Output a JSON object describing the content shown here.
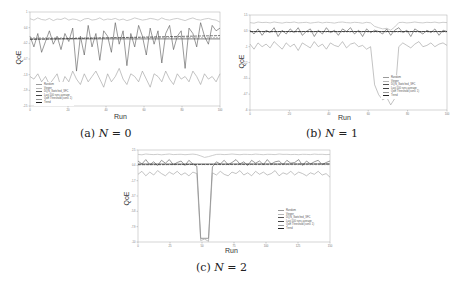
{
  "figure": {
    "captions": {
      "a": {
        "prefix": "(a) ",
        "var": "N",
        "eq": " = 0"
      },
      "b": {
        "prefix": "(b) ",
        "var": "N",
        "eq": " = 1"
      },
      "c": {
        "prefix": "(c) ",
        "var": "N",
        "eq": " = 2"
      }
    },
    "xlabel": "Run",
    "ylabel": "QoE",
    "legend": [
      "Random",
      "Viewer",
      "DQN_Switched_SFC",
      "Last 100 runs average",
      "QoE Threshold (conv. 1)",
      "Trend"
    ]
  },
  "chart_data": [
    {
      "type": "line",
      "title": "(a) N = 0",
      "xlabel": "Run",
      "ylabel": "QoE",
      "xticks": [
        0,
        20,
        40,
        60,
        80,
        100
      ],
      "xlim": [
        0,
        100
      ],
      "ylim": [
        -2.5,
        1.0
      ],
      "legend_position": "lower left",
      "grid": false,
      "series": [
        {
          "name": "Viewer",
          "values": [
            0.75,
            0.7,
            0.78,
            0.72,
            0.7,
            0.76,
            0.68,
            0.74,
            0.72,
            0.78,
            0.7,
            0.74,
            0.72,
            0.66,
            0.74,
            0.76,
            0.7,
            0.72,
            0.78,
            0.7,
            0.74,
            0.72,
            0.76,
            0.7,
            0.74,
            0.68,
            0.72,
            0.78,
            0.74,
            0.7,
            0.72,
            0.76,
            0.74,
            0.7,
            0.78,
            0.72,
            0.7,
            0.74,
            0.76,
            0.72,
            0.68,
            0.74,
            0.78,
            0.72,
            0.7,
            0.74,
            0.76,
            0.72,
            0.7,
            0.62
          ]
        },
        {
          "name": "DQN_Switched_SFC",
          "values": [
            0.1,
            -0.3,
            0.2,
            -0.5,
            -0.1,
            0.3,
            -0.2,
            0.1,
            -0.4,
            0.2,
            -0.1,
            0.4,
            -1.2,
            0.1,
            -0.6,
            0.5,
            -0.3,
            0.2,
            -0.8,
            0.3,
            0.1,
            -0.5,
            0.6,
            -0.2,
            0.3,
            -1.0,
            0.2,
            -0.3,
            0.5,
            0.1,
            -0.6,
            0.4,
            -0.2,
            0.3,
            -0.9,
            0.2,
            0.5,
            -0.4,
            0.1,
            0.3,
            -1.1,
            0.4,
            0.2,
            -0.3,
            0.6,
            0.1,
            -0.2,
            0.5,
            0.3,
            0.4
          ]
        },
        {
          "name": "Random",
          "values": [
            -1.4,
            -1.5,
            -1.3,
            -1.6,
            -1.4,
            -1.7,
            -1.5,
            -1.3,
            -1.8,
            -1.4,
            -1.6,
            -1.2,
            -1.5,
            -1.7,
            -1.3,
            -1.6,
            -1.4,
            -1.2,
            -1.5,
            -1.8,
            -1.3,
            -1.6,
            -1.4,
            -1.1,
            -1.5,
            -1.7,
            -1.3,
            -1.4,
            -1.6,
            -1.2,
            -1.5,
            -1.8,
            -1.3,
            -1.4,
            -1.6,
            -1.2,
            -1.5,
            -1.7,
            -1.3,
            -1.5,
            -1.4,
            -1.6,
            -1.2,
            -1.4,
            -1.7,
            -1.3,
            -1.5,
            -1.4,
            -1.6,
            -1.3
          ]
        },
        {
          "name": "Last 100 runs average",
          "values": [
            0.0,
            0.0,
            0.0,
            0.0,
            0.0,
            0.0,
            0.0,
            0.0,
            0.0,
            0.0,
            0.0,
            0.0,
            0.0,
            0.0,
            0.0,
            0.0,
            0.0,
            0.0,
            0.0,
            0.0,
            0.0,
            0.0,
            0.0,
            0.0,
            0.0,
            0.0,
            0.0,
            0.0,
            0.0,
            0.0,
            0.0,
            0.0,
            0.0,
            0.0,
            0.0,
            0.0,
            0.0,
            0.0,
            0.0,
            0.0,
            0.0,
            0.0,
            0.0,
            0.0,
            0.0,
            0.0,
            0.0,
            0.0,
            0.0,
            0.0
          ]
        },
        {
          "name": "QoE Threshold (conv. 1)",
          "values": [
            0.05
          ]
        },
        {
          "name": "Trend",
          "values": [
            -0.02,
            0.12
          ]
        }
      ]
    },
    {
      "type": "line",
      "title": "(b) N = 1",
      "xlabel": "Run",
      "ylabel": "QoE",
      "xticks": [
        0,
        20,
        40,
        60,
        80,
        100
      ],
      "xlim": [
        0,
        100
      ],
      "ylim": [
        -6,
        1.5
      ],
      "legend_position": "lower right",
      "grid": false,
      "series": [
        {
          "name": "Viewer",
          "values": [
            0.9,
            0.85,
            0.95,
            0.9,
            0.92,
            0.88,
            0.95,
            0.9,
            0.86,
            0.92,
            0.9,
            0.95,
            0.88,
            0.9,
            0.92,
            0.86,
            0.9,
            0.94,
            0.88,
            0.92,
            0.9,
            0.86,
            0.92,
            0.95,
            0.9,
            0.88,
            0.92,
            0.9,
            0.85,
            0.92,
            0.88,
            0.6,
            0.5,
            0.4,
            0.45,
            0.3,
            0.55,
            0.9,
            0.92,
            0.88,
            0.9,
            0.95,
            0.9,
            0.88,
            0.92,
            0.9,
            0.94,
            0.88,
            0.92,
            0.9
          ]
        },
        {
          "name": "DQN_Switched_SFC",
          "values": [
            0.3,
            0.0,
            0.4,
            -0.1,
            0.3,
            0.1,
            0.5,
            -0.2,
            0.3,
            0.0,
            0.4,
            0.1,
            0.5,
            -0.1,
            0.2,
            0.4,
            -0.2,
            0.3,
            0.0,
            0.5,
            0.1,
            0.3,
            -0.1,
            0.4,
            0.2,
            0.5,
            0.0,
            0.3,
            -0.2,
            0.4,
            0.1,
            0.3,
            0.2,
            0.0,
            0.4,
            -0.1,
            0.3,
            0.5,
            0.1,
            0.3,
            -0.2,
            0.4,
            0.2,
            0.0,
            0.3,
            0.1,
            0.4,
            -0.1,
            0.3,
            0.2
          ]
        },
        {
          "name": "Random",
          "values": [
            -0.8,
            -1.2,
            -0.7,
            -1.0,
            -0.8,
            -1.1,
            -0.6,
            -0.9,
            -1.2,
            -0.7,
            -1.0,
            -0.8,
            -1.3,
            -0.7,
            -0.9,
            -1.1,
            -0.6,
            -1.0,
            -0.8,
            -1.2,
            -0.7,
            -0.9,
            -1.0,
            -0.6,
            -1.1,
            -0.8,
            -0.7,
            -1.0,
            -0.9,
            -1.2,
            -1.0,
            -4.0,
            -4.8,
            -5.2,
            -5.0,
            -5.6,
            -5.1,
            -1.0,
            -0.7,
            -0.9,
            -1.1,
            -0.8,
            -0.6,
            -1.0,
            -0.9,
            -0.7,
            -1.0,
            -0.8,
            -0.7,
            -0.9
          ]
        },
        {
          "name": "Last 100 runs average",
          "values": [
            0.2
          ]
        },
        {
          "name": "QoE Threshold (conv. 1)",
          "values": [
            0.15
          ]
        },
        {
          "name": "Trend",
          "values": [
            0.2,
            0.2
          ]
        }
      ]
    },
    {
      "type": "line",
      "title": "(c) N = 2",
      "xlabel": "Run",
      "ylabel": "QoE",
      "xticks": [
        0,
        25,
        50,
        75,
        100,
        125,
        150
      ],
      "xlim": [
        0,
        150
      ],
      "ylim": [
        -10,
        2.5
      ],
      "legend_position": "lower right",
      "grid": false,
      "series": [
        {
          "name": "Viewer",
          "values": [
            1.9,
            1.85,
            1.95,
            1.9,
            1.88,
            1.92,
            1.85,
            1.9,
            1.95,
            1.88,
            1.9,
            1.92,
            1.86,
            1.9,
            1.94,
            1.88,
            1.7,
            1.5,
            1.6,
            1.75,
            1.9,
            1.92,
            1.88,
            1.9,
            1.95,
            1.9,
            1.86,
            1.92,
            1.9,
            1.88,
            1.94,
            1.9,
            1.86,
            1.92,
            1.9,
            1.88,
            1.95,
            1.9,
            1.92,
            1.88,
            1.9,
            1.86,
            1.92,
            1.9,
            1.88,
            1.94,
            1.9,
            1.92,
            1.88,
            1.9
          ]
        },
        {
          "name": "DQN_Switched_SFC",
          "values": [
            1.0,
            0.6,
            1.2,
            0.5,
            0.9,
            0.4,
            1.1,
            0.7,
            1.2,
            0.5,
            0.8,
            1.0,
            0.4,
            1.1,
            0.6,
            0.3,
            -9.5,
            -9.5,
            -9.5,
            0.2,
            0.9,
            0.6,
            1.1,
            0.5,
            0.8,
            1.2,
            0.6,
            0.9,
            0.4,
            1.1,
            0.7,
            1.0,
            0.5,
            1.2,
            0.6,
            0.9,
            1.0,
            0.5,
            1.1,
            0.7,
            0.8,
            1.2,
            0.4,
            1.0,
            0.6,
            0.9,
            1.1,
            0.5,
            0.8,
            1.0
          ]
        },
        {
          "name": "Random",
          "values": [
            -0.8,
            -0.4,
            -1.0,
            -0.5,
            -0.9,
            -0.3,
            -0.7,
            -1.0,
            -0.5,
            -0.8,
            -0.4,
            -0.9,
            -0.6,
            -1.0,
            -0.5,
            -0.7,
            -9.8,
            -9.6,
            -9.9,
            -0.6,
            -0.9,
            -0.4,
            -0.8,
            -1.0,
            -0.5,
            -0.7,
            -0.3,
            -0.9,
            -0.6,
            -1.0,
            -0.4,
            -0.8,
            -0.5,
            -0.9,
            -0.7,
            -0.3,
            -1.0,
            -0.6,
            -0.8,
            -0.4,
            -0.9,
            -0.5,
            -0.7,
            -1.0,
            -0.6,
            -0.8,
            -0.4,
            -0.9,
            -0.7,
            -1.2
          ]
        },
        {
          "name": "Last 100 runs average",
          "values": [
            0.6
          ]
        },
        {
          "name": "QoE Threshold (conv. 1)",
          "values": [
            0.5
          ]
        },
        {
          "name": "Trend",
          "values": [
            0.5,
            0.6
          ]
        }
      ]
    }
  ]
}
